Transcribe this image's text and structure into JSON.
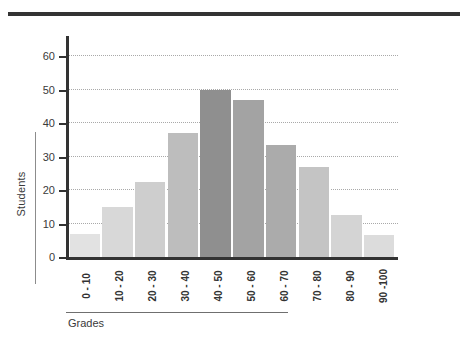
{
  "chart_data": {
    "type": "bar",
    "title": "",
    "xlabel": "Grades",
    "ylabel": "Students",
    "categories": [
      "0 - 10",
      "10 - 20",
      "20 - 30",
      "30 - 40",
      "40 - 50",
      "50 - 60",
      "60 - 70",
      "70 - 80",
      "80 - 90",
      "90 -100"
    ],
    "values": [
      7,
      15,
      22.5,
      37,
      50,
      47,
      33.5,
      27,
      12.5,
      6.5
    ],
    "bar_colors": [
      "#e2e2e2",
      "#d8d8d8",
      "#cecece",
      "#bdbdbd",
      "#8f8f8f",
      "#a3a3a3",
      "#ababab",
      "#c4c4c4",
      "#d4d4d4",
      "#dcdcdc"
    ],
    "ylim": [
      0,
      66
    ],
    "yticks": [
      0,
      10,
      20,
      30,
      40,
      50,
      60
    ],
    "ytick_labels": [
      "0",
      "10",
      "20",
      "30",
      "40",
      "50",
      "60"
    ],
    "gridlines": [
      10,
      20,
      30,
      40,
      50,
      60
    ],
    "grid": true,
    "grid_style": "dotted",
    "legend": "none",
    "axis_color": "#333333",
    "grid_color": "#a9a9a9",
    "text_color": "#3a3a3a"
  }
}
